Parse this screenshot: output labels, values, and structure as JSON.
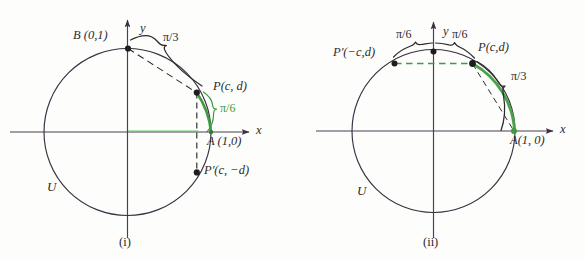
{
  "figure": {
    "background_color": "#fdfdfc",
    "ink_color": "#2b2b2b",
    "accent_green": "#3f9a40",
    "light_green": "#63c763"
  },
  "panels": [
    {
      "id": "i",
      "caption": "(i)",
      "circle_label": "U",
      "axis_x_label": "x",
      "axis_y_label": "y",
      "points": [
        {
          "name": "B",
          "label": "B (0,1)",
          "x": 0,
          "y": 1
        },
        {
          "name": "A",
          "label": "A (1,0)",
          "x": 1,
          "y": 0
        },
        {
          "name": "P",
          "label": "P(c, d)",
          "x": 0.866,
          "y": 0.5
        },
        {
          "name": "Pp",
          "label": "P′(c, −d)",
          "x": 0.866,
          "y": -0.5
        }
      ],
      "arcs": [
        {
          "label": "π/3",
          "from": "B",
          "to": "P",
          "color": "#2b2b2b"
        },
        {
          "label": "π/6",
          "from": "P",
          "to": "A",
          "color": "#3f9a40"
        }
      ]
    },
    {
      "id": "ii",
      "caption": "(ii)",
      "circle_label": "U",
      "axis_x_label": "x",
      "axis_y_label": "y",
      "points": [
        {
          "name": "A",
          "label": "A(1, 0)",
          "x": 1,
          "y": 0
        },
        {
          "name": "P",
          "label": "P(c,d)",
          "x": 0.5,
          "y": 0.866
        },
        {
          "name": "Pp",
          "label": "P′(−c,d)",
          "x": -0.5,
          "y": 0.866
        }
      ],
      "arcs": [
        {
          "label": "π/6",
          "from": "Pp",
          "to": "B",
          "color": "#2b2b2b"
        },
        {
          "label": "π/6",
          "from": "B",
          "to": "P",
          "color": "#2b2b2b"
        },
        {
          "label": "π/3",
          "from": "P",
          "to": "A",
          "color": "#2b2b2b"
        }
      ]
    }
  ]
}
